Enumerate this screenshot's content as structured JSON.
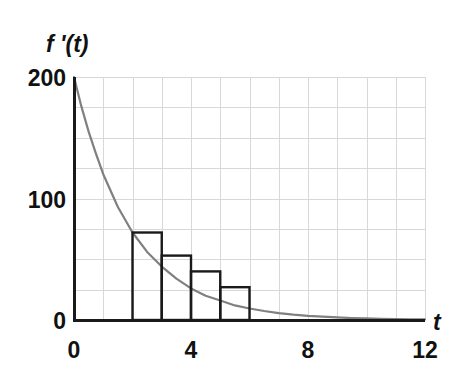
{
  "chart_data": {
    "type": "line",
    "title": "",
    "subtitle": "",
    "xlabel": "t",
    "ylabel": "f '(t)",
    "xlim": [
      0,
      12
    ],
    "ylim": [
      0,
      200
    ],
    "x_ticks": [
      "0",
      "4",
      "8",
      "12"
    ],
    "x_tick_values": [
      0,
      4,
      8,
      12
    ],
    "y_ticks": [
      "0",
      "100",
      "200"
    ],
    "y_tick_values": [
      0,
      100,
      200
    ],
    "grid": true,
    "grid_x_step": 1,
    "grid_y_step": 25,
    "legend": "none",
    "series": [
      {
        "name": "f '(t)",
        "type": "line",
        "color": "#808080",
        "description": "exponential decay curve starting at 200 when t=0 and approaching 0 as t approaches 12",
        "x": [
          0,
          0.25,
          0.5,
          0.75,
          1,
          1.5,
          2,
          2.5,
          3,
          3.5,
          4,
          4.5,
          5,
          5.5,
          6,
          6.5,
          7,
          7.5,
          8,
          8.5,
          9,
          9.5,
          10,
          10.5,
          11,
          11.5,
          12
        ],
        "y": [
          200,
          176,
          155,
          137,
          120,
          93,
          72,
          56,
          44,
          34,
          26,
          20,
          16,
          12,
          9.5,
          7.4,
          5.7,
          4.4,
          3.4,
          2.7,
          2.1,
          1.6,
          1.3,
          1.0,
          0.8,
          0.6,
          0.5
        ]
      },
      {
        "name": "left-endpoint rectangles",
        "type": "bar",
        "color": "#1a1a1a",
        "fill": "none",
        "bar_width": 1,
        "categories": [
          "2",
          "3",
          "4",
          "5"
        ],
        "x_left": [
          2,
          3,
          4,
          5
        ],
        "x_right": [
          3,
          4,
          5,
          6
        ],
        "values": [
          72,
          53,
          40,
          27
        ]
      }
    ]
  },
  "labels": {
    "y_axis": "f '(t)",
    "x_axis": "t",
    "y_tick_0": "0",
    "y_tick_100": "100",
    "y_tick_200": "200",
    "x_tick_0": "0",
    "x_tick_4": "4",
    "x_tick_8": "8",
    "x_tick_12": "12"
  },
  "colors": {
    "curve": "#808080",
    "bar_outline": "#1a1a1a",
    "axis": "#1a1a1a",
    "grid": "#d8d8d8",
    "text": "#111111",
    "background": "#ffffff"
  }
}
